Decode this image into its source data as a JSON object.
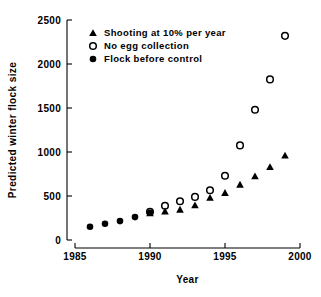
{
  "chart_data": {
    "type": "scatter",
    "title": "",
    "xlabel": "Year",
    "ylabel": "Predicted winter flock size",
    "xlim": [
      1985,
      2000
    ],
    "ylim": [
      0,
      2500
    ],
    "xticks": [
      1985,
      1990,
      1995,
      2000
    ],
    "yticks": [
      0,
      500,
      1000,
      1500,
      2000,
      2500
    ],
    "grid": false,
    "legend_position": "upper-left-inside",
    "series": [
      {
        "name": "Shooting at 10% per year",
        "marker": "filled-triangle",
        "color": "#000000",
        "x": [
          1990,
          1991,
          1992,
          1993,
          1994,
          1995,
          1996,
          1997,
          1998,
          1999
        ],
        "values": [
          305,
          325,
          345,
          395,
          480,
          535,
          630,
          725,
          830,
          960
        ]
      },
      {
        "name": "No egg collection",
        "marker": "open-circle",
        "color": "#000000",
        "x": [
          1990,
          1991,
          1992,
          1993,
          1994,
          1995,
          1996,
          1997,
          1998,
          1999
        ],
        "values": [
          320,
          390,
          440,
          490,
          565,
          730,
          1075,
          1480,
          1825,
          2320
        ]
      },
      {
        "name": "Flock before control",
        "marker": "filled-circle",
        "color": "#000000",
        "x": [
          1986,
          1987,
          1988,
          1989,
          1990
        ],
        "values": [
          150,
          185,
          215,
          260,
          310
        ]
      }
    ]
  },
  "legend": {
    "entries": [
      {
        "label": "Shooting at 10% per year",
        "marker": "filled-triangle"
      },
      {
        "label": "No egg collection",
        "marker": "open-circle"
      },
      {
        "label": "Flock before control",
        "marker": "filled-circle"
      }
    ]
  }
}
